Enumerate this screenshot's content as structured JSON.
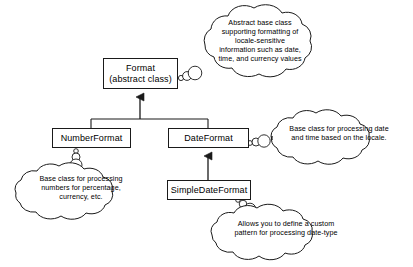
{
  "diagram": {
    "type": "uml-class-diagram",
    "background_color": "#ffffff",
    "line_color": "#1a1a1a",
    "text_color": "#000000",
    "classes": [
      {
        "id": "format",
        "name": "Format",
        "stereotype": "(abstract class)",
        "abstract": true
      },
      {
        "id": "numberformat",
        "name": "NumberFormat",
        "abstract": false
      },
      {
        "id": "dateformat",
        "name": "DateFormat",
        "abstract": false
      },
      {
        "id": "simpledateformat",
        "name": "SimpleDateFormat",
        "abstract": false
      }
    ],
    "relationships": [
      {
        "from": "NumberFormat",
        "to": "Format",
        "type": "generalization"
      },
      {
        "from": "DateFormat",
        "to": "Format",
        "type": "generalization"
      },
      {
        "from": "SimpleDateFormat",
        "to": "DateFormat",
        "type": "generalization"
      }
    ],
    "annotations": [
      {
        "id": "note-format",
        "attached_to": "Format",
        "shape": "thought-cloud",
        "lines": [
          "Abstract base class",
          "supporting formatting of",
          "locale-sensitive",
          "information such as date,",
          "time, and currency values"
        ]
      },
      {
        "id": "note-dateformat",
        "attached_to": "DateFormat",
        "shape": "thought-cloud",
        "lines": [
          "Base class for processing date",
          "and time based on the locale."
        ]
      },
      {
        "id": "note-numberformat",
        "attached_to": "NumberFormat",
        "shape": "thought-cloud",
        "lines": [
          "Base class for processing",
          "numbers for percentage,",
          "currency, etc."
        ]
      },
      {
        "id": "note-simpledateformat",
        "attached_to": "SimpleDateFormat",
        "shape": "thought-cloud",
        "lines": [
          "Allows you to define a custom",
          "pattern for processing date-type"
        ]
      }
    ]
  }
}
